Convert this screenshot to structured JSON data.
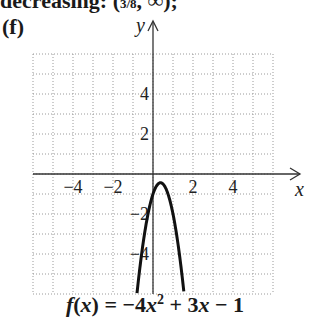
{
  "header": {
    "cut_text": "decreasing: (",
    "cut_fraction": "3/8",
    "cut_rest": ", ∞);"
  },
  "part_label": "(f)",
  "caption": "f(x) = −4x² + 3x − 1",
  "chart_data": {
    "type": "line",
    "xlabel": "x",
    "ylabel": "y",
    "xlim": [
      -6,
      6
    ],
    "ylim": [
      -6,
      6
    ],
    "grid": true,
    "x_ticks": [
      -4,
      -2,
      2,
      4
    ],
    "y_ticks": [
      -4,
      -2,
      2,
      4
    ],
    "x_tick_labels": [
      "−4",
      "−2",
      "2",
      "4"
    ],
    "y_tick_labels": [
      "−4",
      "−2",
      "2",
      "4"
    ],
    "series": [
      {
        "name": "f(x) = −4x² + 3x − 1",
        "function": "-4*x^2 + 3*x - 1",
        "vertex": [
          0.375,
          -0.4375
        ],
        "x": [
          -0.8,
          -0.5,
          -0.25,
          0,
          0.25,
          0.375,
          0.5,
          0.75,
          1.0,
          1.25,
          1.55
        ],
        "y": [
          -5.96,
          -3.5,
          -2.0,
          -1.0,
          -0.5,
          -0.4375,
          -0.5,
          -1.0,
          -2.0,
          -3.5,
          -5.96
        ]
      }
    ]
  }
}
